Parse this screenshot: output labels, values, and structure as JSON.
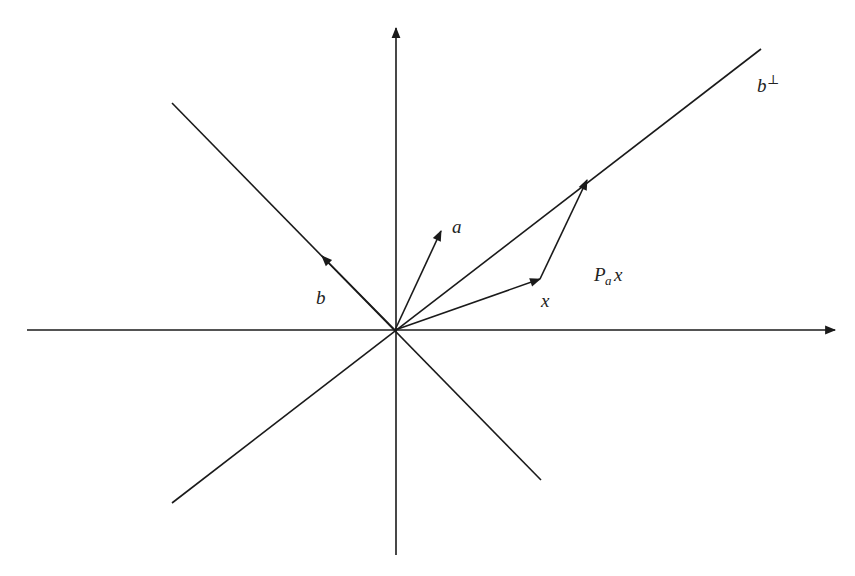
{
  "diagram": {
    "title": "",
    "colors": {
      "stroke": "#1a1a1a",
      "text": "#222222",
      "background": "#ffffff"
    },
    "origin": [
      395,
      330
    ],
    "axes": {
      "x_axis": {
        "from": [
          27,
          330
        ],
        "to": [
          835,
          330
        ],
        "arrow": true
      },
      "y_axis": {
        "from": [
          396,
          555
        ],
        "to": [
          396,
          28
        ],
        "arrow": true
      }
    },
    "lines": [
      {
        "name": "line-b",
        "from": [
          172,
          103
        ],
        "to": [
          541,
          480
        ]
      },
      {
        "name": "line-b-perp",
        "from": [
          761,
          49
        ],
        "to": [
          172,
          503
        ]
      }
    ],
    "vectors": [
      {
        "name": "vector-a",
        "from": [
          395,
          330
        ],
        "to": [
          441,
          231
        ]
      },
      {
        "name": "vector-b",
        "from": [
          395,
          330
        ],
        "to": [
          322,
          256
        ]
      },
      {
        "name": "vector-x",
        "from": [
          395,
          330
        ],
        "to": [
          540,
          279
        ]
      },
      {
        "name": "vector-pax",
        "from": [
          540,
          279
        ],
        "to": [
          587,
          180
        ]
      }
    ],
    "labels": {
      "a": {
        "text": "a",
        "x": 452,
        "y": 233
      },
      "b": {
        "text": "b",
        "x": 316,
        "y": 304
      },
      "x": {
        "text": "x",
        "x": 541,
        "y": 307
      },
      "b_perp_base": {
        "text": "b",
        "x": 757,
        "y": 92
      },
      "b_perp_sup": {
        "text": "⊥",
        "x": 767,
        "y": 84
      },
      "pax_P": {
        "text": "P",
        "x": 594,
        "y": 281
      },
      "pax_sub": {
        "text": "a",
        "x": 605,
        "y": 285
      },
      "pax_x": {
        "text": "x",
        "x": 614,
        "y": 281
      }
    }
  }
}
